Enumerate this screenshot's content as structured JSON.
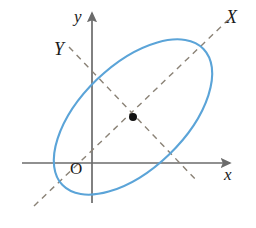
{
  "figure": {
    "width": 256,
    "height": 228,
    "background_color": "#ffffff"
  },
  "labels": {
    "x_axis": "x",
    "y_axis": "y",
    "X_axis_rotated": "X",
    "Y_axis_rotated": "Y",
    "origin": "O"
  },
  "colors": {
    "curve": "#5ba4d8",
    "axis": "#6b6b6b",
    "dashed_axis": "#8a8276",
    "center_point": "#111111",
    "text": "#1a1a1a"
  },
  "chart_data": {
    "type": "scatter",
    "xlabel": "x",
    "ylabel": "y",
    "grid": false,
    "legend": null,
    "axes": [
      {
        "name": "x",
        "style": "solid",
        "arrow": true,
        "from": [
          22,
          163
        ],
        "to": [
          230,
          163
        ]
      },
      {
        "name": "y",
        "style": "solid",
        "arrow": true,
        "from": [
          92,
          203
        ],
        "to": [
          92,
          13
        ]
      },
      {
        "name": "X",
        "style": "dashed",
        "arrow": false,
        "from": [
          34,
          206
        ],
        "to": [
          228,
          20
        ]
      },
      {
        "name": "Y",
        "style": "dashed",
        "arrow": false,
        "from": [
          69,
          47
        ],
        "to": [
          197,
          181
        ]
      }
    ],
    "ellipse": {
      "center": [
        133,
        117
      ],
      "semi_major": 98,
      "semi_minor": 52,
      "rotation_deg": -44,
      "stroke": "#5ba4d8"
    },
    "points": [
      {
        "label": "center",
        "coords": [
          133,
          117
        ],
        "marker": "filled-circle",
        "radius": 4
      }
    ]
  }
}
